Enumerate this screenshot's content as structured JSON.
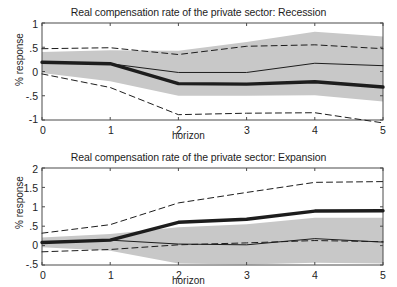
{
  "figure": {
    "width": 397,
    "height": 287,
    "background": "#ffffff",
    "ink": "#1d1d1d",
    "band_color": "#c8c8c8"
  },
  "panels": [
    {
      "id": "recession",
      "title": "Real compensation rate of the private sector: Recession",
      "xlabel": "horizon",
      "ylabel": "% response",
      "xticks": [
        "0",
        "1",
        "2",
        "3",
        "4",
        "5"
      ],
      "yticks": [
        "1",
        ".5",
        "0",
        "-.5",
        "-1"
      ]
    },
    {
      "id": "expansion",
      "title": "Real compensation rate of the private sector: Expansion",
      "xlabel": "horizon",
      "ylabel": "% response",
      "xticks": [
        "0",
        "1",
        "2",
        "3",
        "4",
        "5"
      ],
      "yticks": [
        "2",
        "1.5",
        "1",
        ".5",
        "0",
        "-.5"
      ]
    }
  ],
  "chart_data": [
    {
      "type": "line",
      "id": "recession",
      "title": "Real compensation rate of the private sector: Recession",
      "xlabel": "horizon",
      "ylabel": "% response",
      "x": [
        0,
        1,
        2,
        3,
        4,
        5
      ],
      "xlim": [
        0,
        5
      ],
      "ylim": [
        -1,
        1
      ],
      "yticks": [
        -1,
        -0.5,
        0,
        0.5,
        1
      ],
      "grid": false,
      "legend": "none",
      "series": [
        {
          "name": "point estimate (recession, thick solid)",
          "style": "solid-thick",
          "values": [
            0.19,
            0.16,
            -0.25,
            -0.26,
            -0.21,
            -0.32
          ]
        },
        {
          "name": "comparison estimate (thin solid)",
          "style": "solid-thin",
          "values": [
            0.19,
            0.16,
            -0.02,
            -0.02,
            0.17,
            0.12
          ]
        },
        {
          "name": "upper confidence band (dashed)",
          "style": "dashed",
          "values": [
            0.47,
            0.49,
            0.35,
            0.52,
            0.55,
            0.47
          ]
        },
        {
          "name": "lower confidence band (dashed)",
          "style": "dashed",
          "values": [
            -0.05,
            -0.33,
            -0.89,
            -0.86,
            -0.85,
            -1.06
          ]
        },
        {
          "name": "shaded band upper",
          "style": "shaded-edge",
          "values": [
            0.4,
            0.44,
            0.43,
            0.61,
            0.82,
            0.72
          ]
        },
        {
          "name": "shaded band lower",
          "style": "shaded-edge",
          "values": [
            -0.03,
            -0.2,
            -0.5,
            -0.5,
            -0.49,
            -0.62
          ]
        }
      ]
    },
    {
      "type": "line",
      "id": "expansion",
      "title": "Real compensation rate of the private sector: Expansion",
      "xlabel": "horizon",
      "ylabel": "% response",
      "x": [
        0,
        1,
        2,
        3,
        4,
        5
      ],
      "xlim": [
        0,
        5
      ],
      "ylim": [
        -0.5,
        2
      ],
      "yticks": [
        -0.5,
        0,
        0.5,
        1,
        1.5,
        2
      ],
      "grid": false,
      "legend": "none",
      "series": [
        {
          "name": "point estimate (expansion, thick solid)",
          "style": "solid-thick",
          "values": [
            0.08,
            0.14,
            0.6,
            0.68,
            0.89,
            0.9
          ]
        },
        {
          "name": "comparison estimate (thin solid)",
          "style": "solid-thin",
          "values": [
            0.08,
            0.14,
            0.04,
            0.02,
            0.18,
            0.09
          ]
        },
        {
          "name": "upper confidence band (dashed)",
          "style": "dashed",
          "values": [
            0.32,
            0.54,
            1.1,
            1.37,
            1.63,
            1.65
          ]
        },
        {
          "name": "lower confidence band (dashed)",
          "style": "dashed",
          "values": [
            -0.16,
            -0.1,
            0.02,
            0.07,
            0.13,
            0.1
          ]
        },
        {
          "name": "shaded band upper",
          "style": "shaded-edge",
          "values": [
            0.21,
            0.3,
            0.47,
            0.55,
            0.72,
            0.72
          ]
        },
        {
          "name": "shaded band lower",
          "style": "shaded-edge",
          "values": [
            -0.04,
            -0.13,
            -0.46,
            -0.49,
            -0.44,
            -0.46
          ]
        }
      ]
    }
  ]
}
